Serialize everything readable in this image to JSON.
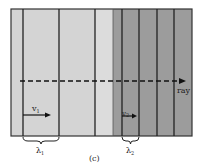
{
  "figure": {
    "caption": "(c)",
    "frame": {
      "x": 11,
      "y": 9,
      "width": 181,
      "height": 127
    },
    "regions": [
      {
        "name": "medium-1",
        "x": 11,
        "width": 102,
        "color": "#d4d4d4"
      },
      {
        "name": "medium-1-band",
        "x": 95,
        "width": 18,
        "color": "#dcdcdc"
      },
      {
        "name": "medium-2",
        "x": 113,
        "width": 79,
        "color": "#9c9c9c"
      }
    ],
    "wavefronts_medium1_x": [
      23,
      59,
      95
    ],
    "wavefronts_medium2_x": [
      122,
      139,
      157,
      174
    ],
    "ray": {
      "label": "ray",
      "y": 81,
      "x_start": 20,
      "x_end": 186
    },
    "v1": {
      "label": "v",
      "sub": "1"
    },
    "v2": {
      "label": "v",
      "sub": "2"
    },
    "lambda1": {
      "label": "λ",
      "sub": "1",
      "x_start": 23,
      "x_end": 59
    },
    "lambda2": {
      "label": "λ",
      "sub": "2",
      "x_start": 122,
      "x_end": 139
    }
  }
}
